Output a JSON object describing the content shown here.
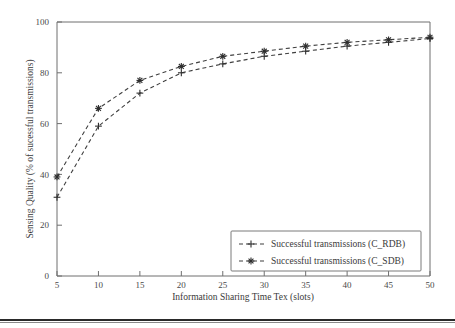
{
  "chart_data": {
    "type": "line",
    "title": "",
    "xlabel": "Information Sharing Time Tex (slots)",
    "ylabel": "Sensing Quality (% of sucessful transmissions)",
    "x": [
      5,
      10,
      15,
      20,
      25,
      30,
      35,
      40,
      45,
      50
    ],
    "xlim": [
      5,
      50
    ],
    "ylim": [
      0,
      100
    ],
    "xticks": [
      "5",
      "10",
      "15",
      "20",
      "25",
      "30",
      "35",
      "40",
      "45",
      "50"
    ],
    "yticks": [
      "0",
      "20",
      "40",
      "60",
      "80",
      "100"
    ],
    "grid": false,
    "legend_position": "lower-right",
    "series": [
      {
        "name": "Successful transmissions (C_RDB)",
        "marker": "plus",
        "linestyle": "dashed",
        "color": "#3f3f3f",
        "values": [
          31,
          59,
          72,
          80,
          83.5,
          86.5,
          88.5,
          90.5,
          92,
          93.5
        ]
      },
      {
        "name": "Successful transmissions (C_SDB)",
        "marker": "asterisk",
        "linestyle": "dashed",
        "color": "#3f3f3f",
        "values": [
          39,
          66,
          77,
          82.5,
          86.5,
          88.5,
          90.5,
          92,
          93,
          94
        ]
      }
    ]
  },
  "legend": {
    "entries": [
      {
        "label": "Successful transmissions (C_RDB)",
        "marker": "plus"
      },
      {
        "label": "Successful transmissions (C_SDB)",
        "marker": "asterisk"
      }
    ]
  },
  "axes": {
    "x_title": "Information Sharing Time Tex (slots)",
    "y_title": "Sensing Quality (% of sucessful transmissions)"
  },
  "colors": {
    "line": "#3f3f3f",
    "axis": "#6f6f6f",
    "text": "#3a3a3a",
    "rule": "#2a2a2a"
  }
}
